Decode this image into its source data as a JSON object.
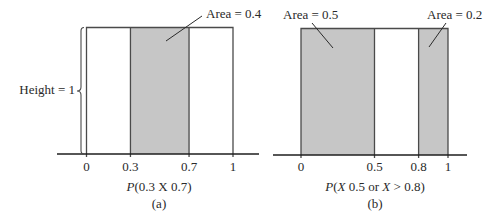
{
  "colors": {
    "shade": "#c6c6c6",
    "outline": "#4a4a4a",
    "axis": "#1e1e1e",
    "text": "#2a2a2a",
    "leader": "#2a2a2a"
  },
  "chart_data": [
    {
      "id": "a",
      "type": "area",
      "title": "P(0.3  X  0.7)",
      "caption": "(a)",
      "xlim": [
        0,
        1
      ],
      "ylim": [
        0,
        1
      ],
      "density_height": 1,
      "xticks": [
        0,
        0.3,
        0.7,
        1
      ],
      "xtick_labels": [
        "0",
        "0.3",
        "0.7",
        "1"
      ],
      "shaded": [
        [
          0.3,
          0.7
        ]
      ],
      "formula_parts": [
        {
          "t": "P",
          "italic": true
        },
        {
          "t": "(0.3  ",
          "italic": false
        },
        {
          "t": "X",
          "italic": false
        },
        {
          "t": "  0.7)",
          "italic": false
        }
      ],
      "annotations": [
        {
          "text": "Area = 0.4",
          "value": 0.4
        }
      ],
      "height_label": "Height = 1",
      "xlabel": "",
      "ylabel": "",
      "grid": false
    },
    {
      "id": "b",
      "type": "area",
      "title": "P(X  0.5 or X > 0.8)",
      "caption": "(b)",
      "xlim": [
        0,
        1
      ],
      "ylim": [
        0,
        1
      ],
      "density_height": 1,
      "xticks": [
        0,
        0.5,
        0.8,
        1
      ],
      "xtick_labels": [
        "0",
        "0.5",
        "0.8",
        "1"
      ],
      "shaded": [
        [
          0,
          0.5
        ],
        [
          0.8,
          1
        ]
      ],
      "formula_parts": [
        {
          "t": "P",
          "italic": true
        },
        {
          "t": "(",
          "italic": false
        },
        {
          "t": "X",
          "italic": true
        },
        {
          "t": "  0.5 or ",
          "italic": false
        },
        {
          "t": "X",
          "italic": true
        },
        {
          "t": " > 0.8)",
          "italic": false
        }
      ],
      "annotations": [
        {
          "text": "Area = 0.5",
          "value": 0.5
        },
        {
          "text": "Area = 0.2",
          "value": 0.2
        }
      ],
      "xlabel": "",
      "ylabel": "",
      "grid": false
    }
  ]
}
